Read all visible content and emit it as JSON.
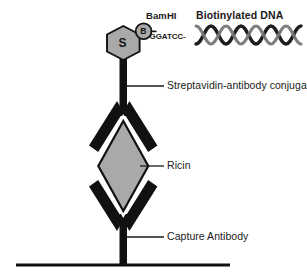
{
  "figure": {
    "background_color": "#ffffff"
  },
  "colors": {
    "stroke": "#111111",
    "gray_fill": "#a9a9a9",
    "gray_fill_dark": "#9a9a9a",
    "text": "#1a1a1a",
    "white": "#ffffff",
    "leader_line": "#1a1a1a"
  },
  "labels": {
    "bamhi": "BamHI",
    "dna_title": "Biotinylated DNA",
    "restriction_sequence": "-GGATCC-",
    "conjugate": "Streptavidin-antibody conjugate",
    "ricin": "Ricin",
    "capture_antibody": "Capture Antibody"
  },
  "glyphs": {
    "streptavidin": "S",
    "biotin": "B"
  },
  "components": [
    {
      "name": "streptavidin-hexagon",
      "glyph": "S",
      "shape": "hexagon",
      "fill": "#a9a9a9"
    },
    {
      "name": "biotin-circle",
      "glyph": "B",
      "shape": "circle",
      "fill": "#a9a9a9"
    },
    {
      "name": "biotinylated-dna",
      "shape": "double-helix",
      "crossings": 5
    },
    {
      "name": "detection-antibody",
      "shape": "y-antibody-inverted",
      "fill": "#111111"
    },
    {
      "name": "ricin-antigen",
      "shape": "diamond",
      "fill": "#a9a9a9"
    },
    {
      "name": "capture-antibody",
      "shape": "y-antibody",
      "fill": "#111111"
    },
    {
      "name": "solid-support-surface",
      "shape": "baseline"
    }
  ]
}
